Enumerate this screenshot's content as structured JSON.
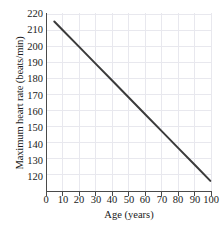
{
  "chart_data": {
    "type": "line",
    "title": "",
    "subtitle": "",
    "xlabel": "Age (years)",
    "ylabel": "Maximum heart rate (beats/min)",
    "xlim": [
      0,
      100
    ],
    "ylim": [
      115,
      220
    ],
    "xticks": [
      0,
      10,
      20,
      30,
      40,
      50,
      60,
      70,
      80,
      90,
      100
    ],
    "xticklabels": [
      "0",
      "10",
      "20",
      "30",
      "40",
      "50",
      "60",
      "70",
      "80",
      "90",
      "100"
    ],
    "yticks": [
      120,
      130,
      140,
      150,
      160,
      170,
      180,
      190,
      200,
      210,
      220
    ],
    "yticklabels": [
      "120",
      "130",
      "140",
      "150",
      "160",
      "170",
      "180",
      "190",
      "200",
      "210",
      "220"
    ],
    "grid": true,
    "grid_color": "#e8e8ee",
    "legend": null,
    "line_color": "#3b3b3b",
    "line_width": 2.0,
    "series": [
      {
        "name": "Maximum heart rate",
        "relation": "heart rate = 220 - age",
        "x": [
          5,
          10,
          20,
          30,
          40,
          50,
          60,
          70,
          80,
          90,
          99
        ],
        "y": [
          215,
          210,
          200,
          190,
          180,
          170,
          160,
          150,
          140,
          130,
          121
        ]
      }
    ],
    "annotations": []
  }
}
